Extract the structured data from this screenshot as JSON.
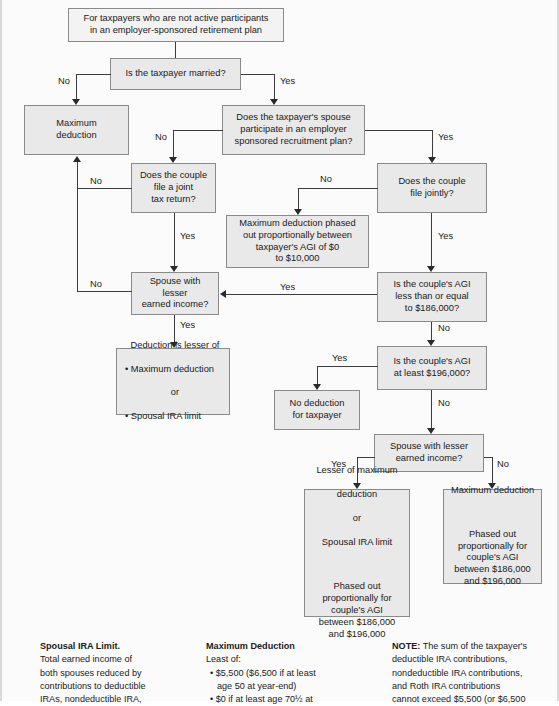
{
  "colors": {
    "node_fill": "#e9e9e9",
    "node_fill_light": "#f3f3f3",
    "node_border": "#8a8a8a",
    "connector": "#3d3d3d",
    "page_bg": "#fbfbfb",
    "text": "#1a1a1a"
  },
  "nodes": {
    "header": "For taxpayers who are not active participants\nin an employer-sponsored retirement plan",
    "q_married": "Is the taxpayer married?",
    "max_deduction": "Maximum\ndeduction",
    "q_spouse_participates": "Does the taxpayer's spouse\nparticipate in an employer\nsponsored recruitment plan?",
    "q_joint_return": "Does the couple\nfile a joint\ntax return?",
    "q_file_jointly": "Does the couple\nfile jointly?",
    "phased_0_10000": "Maximum deduction phased\nout proportionally between\ntaxpayer's AGI of $0\nto $10,000",
    "q_spouse_lesser_left": "Spouse with\nlesser\nearned income?",
    "q_agi_le_186000": "Is the couple's AGI\nless than or equal\nto $186,000?",
    "deduction_lesser_of_title": "Deduction is lesser of",
    "deduction_lesser_item1": "• Maximum deduction",
    "deduction_lesser_or": "or",
    "deduction_lesser_item2": "• Spousal IRA limit",
    "q_agi_at_least_196000": "Is the couple's AGI\nat least $196,000?",
    "no_deduction": "No deduction\nfor taxpayer",
    "q_spouse_lesser_right": "Spouse with lesser\nearned income?",
    "lesser_of_max_line1": "Lesser of maximum",
    "lesser_of_max_line2": "deduction",
    "lesser_of_max_or": "or",
    "lesser_of_max_line3": "Spousal IRA limit",
    "lesser_of_max_phase": "Phased out\nproportionally for\ncouple's AGI\nbetween $186,000\nand $196,000",
    "max_deduction_right_title": "Maximum deduction",
    "max_deduction_right_phase": "Phased out\nproportionally for\ncouple's AGI\nbetween $186,000\nand $196,000"
  },
  "edge_labels": {
    "married_no": "No",
    "married_yes": "Yes",
    "spouse_participates_no": "No",
    "spouse_participates_yes": "Yes",
    "joint_return_no": "No",
    "joint_return_yes": "Yes",
    "file_jointly_no": "No",
    "file_jointly_yes": "Yes",
    "spouse_lesser_left_no": "No",
    "spouse_lesser_left_yes": "Yes",
    "agi_186000_yes": "Yes",
    "agi_186000_no": "No",
    "agi_196000_yes": "Yes",
    "agi_196000_no": "No",
    "spouse_lesser_right_yes": "Yes",
    "spouse_lesser_right_no": "No"
  },
  "footer": {
    "col1": {
      "heading": "Spousal IRA Limit.",
      "lines": [
        "Total earned income of",
        "both spouses reduced by",
        "contributions to deductible",
        "IRAs, nondeductible IRA,"
      ]
    },
    "col2": {
      "heading": "Maximum Deduction",
      "subhead": "Least of:",
      "bullets": [
        "• $5,500 ($6,500 if at least",
        "age 50 at year-end)",
        "• $0 if at least age 70½ at"
      ]
    },
    "col3": {
      "heading": "NOTE:",
      "lines": [
        " The sum of the taxpayer's",
        "deductible IRA contributions,",
        "nondeductible IRA contributions,",
        "and Roth IRA contributions",
        "cannot exceed $5,500 (or $6,500"
      ]
    }
  }
}
